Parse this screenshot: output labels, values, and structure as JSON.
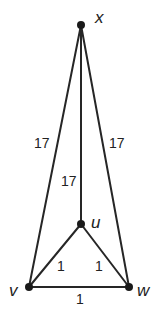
{
  "diagram": {
    "type": "weighted-graph",
    "colors": {
      "line": "#262626",
      "node": "#1a1a1a",
      "text": "#222222",
      "background": "#ffffff"
    },
    "nodes": [
      {
        "id": "x",
        "label": "x",
        "cx": 81,
        "cy": 25,
        "lx": 95,
        "ly": 23
      },
      {
        "id": "u",
        "label": "u",
        "cx": 81,
        "cy": 224,
        "lx": 91,
        "ly": 228
      },
      {
        "id": "v",
        "label": "v",
        "cx": 29,
        "cy": 287,
        "lx": 9,
        "ly": 296
      },
      {
        "id": "w",
        "label": "w",
        "cx": 129,
        "cy": 287,
        "lx": 137,
        "ly": 296
      }
    ],
    "edges": [
      {
        "from": "x",
        "to": "v",
        "weight": "17",
        "lx": 34,
        "ly": 148
      },
      {
        "from": "x",
        "to": "w",
        "weight": "17",
        "lx": 109,
        "ly": 148
      },
      {
        "from": "x",
        "to": "u",
        "weight": "17",
        "lx": 61,
        "ly": 186
      },
      {
        "from": "u",
        "to": "v",
        "weight": "1",
        "lx": 57,
        "ly": 271
      },
      {
        "from": "u",
        "to": "w",
        "weight": "1",
        "lx": 95,
        "ly": 271
      },
      {
        "from": "v",
        "to": "w",
        "weight": "1",
        "lx": 76,
        "ly": 304
      }
    ]
  }
}
